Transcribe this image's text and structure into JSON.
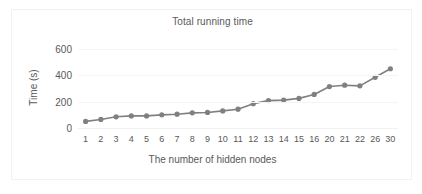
{
  "chart_data": {
    "type": "line",
    "title": "Total running time",
    "xlabel": "The number of hidden nodes",
    "ylabel": "Time (s)",
    "categories": [
      "1",
      "2",
      "3",
      "4",
      "5",
      "6",
      "7",
      "8",
      "9",
      "10",
      "11",
      "12",
      "13",
      "14",
      "15",
      "16",
      "20",
      "21",
      "22",
      "26",
      "30"
    ],
    "values": [
      50,
      65,
      85,
      92,
      92,
      100,
      105,
      115,
      118,
      130,
      143,
      185,
      208,
      212,
      225,
      255,
      315,
      325,
      320,
      385,
      450
    ],
    "ylim": [
      0,
      600
    ],
    "yticks": [
      0,
      200,
      400,
      600
    ],
    "grid": true,
    "legend": "none",
    "series": [
      {
        "name": "Total running time",
        "values": [
          50,
          65,
          85,
          92,
          92,
          100,
          105,
          115,
          118,
          130,
          143,
          185,
          208,
          212,
          225,
          255,
          315,
          325,
          320,
          385,
          450
        ]
      }
    ]
  },
  "style": {
    "series_color": "#808080",
    "text_color": "#595959",
    "grid_color": "#f4f4f4",
    "border_color": "#f2f2f2",
    "background": "#ffffff"
  }
}
